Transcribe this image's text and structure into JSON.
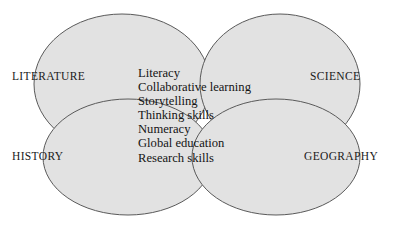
{
  "diagram": {
    "type": "venn-four-ellipse",
    "background_color": "#ffffff",
    "ellipse_fill": "#e2e2e2",
    "ellipse_stroke": "#5a5a5a",
    "text_color": "#141414",
    "corner_labels": [
      {
        "id": "literature",
        "label": "LITERATURE",
        "position": "top-left"
      },
      {
        "id": "science",
        "label": "SCIENCE",
        "position": "top-right"
      },
      {
        "id": "history",
        "label": "HISTORY",
        "position": "bottom-left"
      },
      {
        "id": "geography",
        "label": "GEOGRAPHY",
        "position": "bottom-right"
      }
    ],
    "center_items": [
      "Literacy",
      "Collaborative learning",
      "Storytelling",
      "Thinking skills",
      "Numeracy",
      "Global education",
      "Research skills"
    ]
  }
}
